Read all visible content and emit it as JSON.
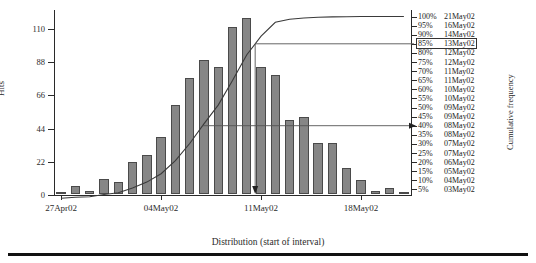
{
  "chart_data": {
    "type": "bar",
    "title": "",
    "xlabel": "Distribution (start of interval)",
    "ylabel": "Hits",
    "y2label": "Cumulative frequency",
    "ylim": [
      0,
      120
    ],
    "yticks": [
      "0",
      "22",
      "44",
      "66",
      "88",
      "110"
    ],
    "ytick_values": [
      0,
      22,
      44,
      66,
      88,
      110
    ],
    "xticks": [
      "27Apr02",
      "04May02",
      "11May02",
      "18May02"
    ],
    "xtick_index": [
      0,
      7,
      14,
      21
    ],
    "grid": false,
    "legend": "none",
    "categories": [
      "27Apr02",
      "28Apr02",
      "29Apr02",
      "30Apr02",
      "01May02",
      "02May02",
      "03May02",
      "04May02",
      "05May02",
      "06May02",
      "07May02",
      "08May02",
      "09May02",
      "10May02",
      "11May02",
      "12May02",
      "13May02",
      "14May02",
      "15May02",
      "16May02",
      "17May02",
      "18May02",
      "19May02",
      "20May02",
      "21May02"
    ],
    "values": [
      1,
      5,
      2,
      10,
      8,
      21,
      26,
      38,
      59,
      77,
      89,
      84,
      111,
      117,
      84,
      79,
      49,
      51,
      34,
      34,
      17,
      9,
      2,
      4,
      1
    ],
    "series": [
      {
        "name": "Hits",
        "type": "bar",
        "values": [
          1,
          5,
          2,
          10,
          8,
          21,
          26,
          38,
          59,
          77,
          89,
          84,
          111,
          117,
          84,
          79,
          49,
          51,
          34,
          34,
          17,
          9,
          2,
          4,
          1
        ]
      },
      {
        "name": "Cumulative frequency",
        "type": "line",
        "unit": "percent",
        "values": [
          0.1,
          0.7,
          1.0,
          2.2,
          3.2,
          5.8,
          9.0,
          13.6,
          20.8,
          30.2,
          41.0,
          51.3,
          64.8,
          79.0,
          89.2,
          96.8,
          98.5,
          99.2,
          99.6,
          99.8,
          99.9,
          100,
          100,
          100,
          100
        ]
      }
    ],
    "right_axis": {
      "title": "Cumulative frequency",
      "rows": [
        {
          "pct": "100%",
          "date": "21May02",
          "highlight": false
        },
        {
          "pct": "95%",
          "date": "16May02",
          "highlight": false
        },
        {
          "pct": "90%",
          "date": "14May02",
          "highlight": false
        },
        {
          "pct": "85%",
          "date": "13May02",
          "highlight": true
        },
        {
          "pct": "80%",
          "date": "12May02",
          "highlight": false
        },
        {
          "pct": "75%",
          "date": "12May02",
          "highlight": false
        },
        {
          "pct": "70%",
          "date": "11May02",
          "highlight": false
        },
        {
          "pct": "65%",
          "date": "11May02",
          "highlight": false
        },
        {
          "pct": "60%",
          "date": "10May02",
          "highlight": false
        },
        {
          "pct": "55%",
          "date": "10May02",
          "highlight": false
        },
        {
          "pct": "50%",
          "date": "09May02",
          "highlight": false
        },
        {
          "pct": "45%",
          "date": "09May02",
          "highlight": false
        },
        {
          "pct": "40%",
          "date": "08May02",
          "highlight": false
        },
        {
          "pct": "35%",
          "date": "08May02",
          "highlight": false
        },
        {
          "pct": "30%",
          "date": "07May02",
          "highlight": false
        },
        {
          "pct": "25%",
          "date": "07May02",
          "highlight": false
        },
        {
          "pct": "20%",
          "date": "06May02",
          "highlight": false
        },
        {
          "pct": "15%",
          "date": "05May02",
          "highlight": false
        },
        {
          "pct": "10%",
          "date": "04May02",
          "highlight": false
        },
        {
          "pct": "5%",
          "date": "03May02",
          "highlight": false
        }
      ]
    },
    "annotations": [
      {
        "name": "percentile-85-guide",
        "pct": "85%",
        "date": "13May02",
        "style": "horizontal leader from ogive to boxed 85% label plus vertical drop line to x-axis with down arrow"
      },
      {
        "name": "percentile-40-guide",
        "pct": "40%",
        "date": "08May02",
        "style": "horizontal line from ogive to right axis with right arrow"
      }
    ],
    "colors": {
      "bar_fill": "#868686",
      "bar_stroke": "#4a4a4a",
      "curve": "#3a3a3a",
      "axis": "#2a2a2a",
      "text": "#222222",
      "rule": "#111111"
    }
  }
}
